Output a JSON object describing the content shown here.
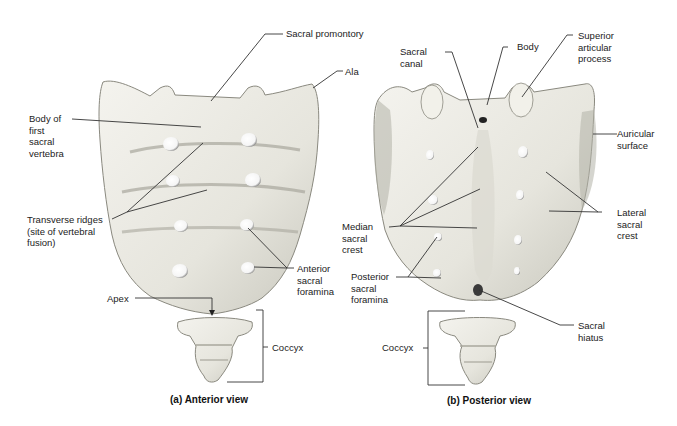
{
  "figure": {
    "panels": [
      {
        "id": "anterior",
        "caption": "(a) Anterior view",
        "labels": {
          "sacral_promontory": "Sacral promontory",
          "ala": "Ala",
          "body_first_sacral": "Body of\nfirst\nsacral\nvertebra",
          "transverse_ridges": "Transverse ridges\n(site of vertebral\nfusion)",
          "anterior_sacral_foramina": "Anterior\nsacral\nforamina",
          "apex": "Apex",
          "coccyx": "Coccyx"
        }
      },
      {
        "id": "posterior",
        "caption": "(b) Posterior view",
        "labels": {
          "sacral_canal": "Sacral\ncanal",
          "body": "Body",
          "superior_articular_process": "Superior\narticular\nprocess",
          "auricular_surface": "Auricular\nsurface",
          "lateral_sacral_crest": "Lateral\nsacral\ncrest",
          "median_sacral_crest": "Median\nsacral\ncrest",
          "posterior_sacral_foramina": "Posterior\nsacral\nforamina",
          "sacral_hiatus": "Sacral\nhiatus",
          "coccyx": "Coccyx"
        }
      }
    ]
  },
  "colors": {
    "bone": "#ecebe4",
    "bone_shadow": "#b9b8ae",
    "line": "#333333",
    "background": "#ffffff"
  }
}
